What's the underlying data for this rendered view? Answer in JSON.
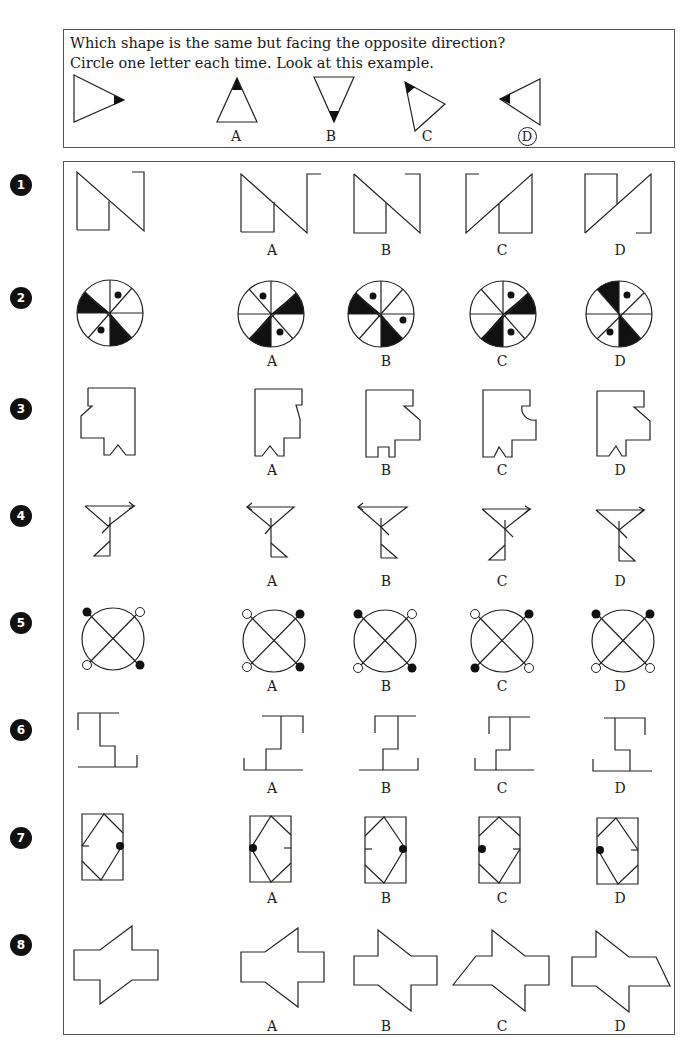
{
  "instructions": {
    "line1": "Which shape is the same but facing the opposite direction?",
    "line2": "Circle one letter each time. Look at this example."
  },
  "example": {
    "prompt_shape": "triangle-pointing-right-with-black-tip",
    "options": [
      {
        "letter": "A",
        "shape": "triangle-pointing-up-with-black-tip",
        "circled": false
      },
      {
        "letter": "B",
        "shape": "triangle-pointing-down-with-black-tip",
        "circled": false
      },
      {
        "letter": "C",
        "shape": "triangle-rotated-with-black-tip",
        "circled": false
      },
      {
        "letter": "D",
        "shape": "triangle-pointing-left-with-black-tip",
        "circled": true
      }
    ]
  },
  "questions": [
    {
      "number": "1",
      "shape": "N-shape",
      "options": [
        "A",
        "B",
        "C",
        "D"
      ]
    },
    {
      "number": "2",
      "shape": "segmented-circle-with-dots",
      "options": [
        "A",
        "B",
        "C",
        "D"
      ]
    },
    {
      "number": "3",
      "shape": "notched-polygon",
      "options": [
        "A",
        "B",
        "C",
        "D"
      ]
    },
    {
      "number": "4",
      "shape": "funnel-with-arrow",
      "options": [
        "A",
        "B",
        "C",
        "D"
      ]
    },
    {
      "number": "5",
      "shape": "crossed-circle-with-knobs",
      "options": [
        "A",
        "B",
        "C",
        "D"
      ]
    },
    {
      "number": "6",
      "shape": "stepped-bracket",
      "options": [
        "A",
        "B",
        "C",
        "D"
      ]
    },
    {
      "number": "7",
      "shape": "rectangle-with-diamond-and-dot",
      "options": [
        "A",
        "B",
        "C",
        "D"
      ]
    },
    {
      "number": "8",
      "shape": "arrow-plus-polygon",
      "options": [
        "A",
        "B",
        "C",
        "D"
      ]
    }
  ],
  "colors": {
    "ink": "#1a1a1a",
    "border": "#555555",
    "badge": "#111111"
  }
}
